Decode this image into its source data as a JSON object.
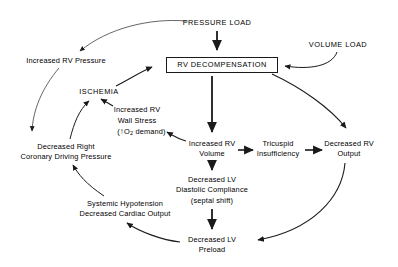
{
  "diagram": {
    "background_color": "#ffffff",
    "line_color": "#1a1a1a",
    "text_color": "#000000",
    "nodes": {
      "pressure_load": {
        "label": "PRESSURE LOAD",
        "x": 217,
        "y": 23
      },
      "volume_load": {
        "label": "VOLUME LOAD",
        "x": 338,
        "y": 45
      },
      "rv_decompensation": {
        "label": "RV DECOMPENSATION",
        "x": 222,
        "y": 65
      },
      "increased_rv_pressure": {
        "label": "Increased RV Pressure",
        "x": 66,
        "y": 61
      },
      "ischemia": {
        "label": "ISCHEMIA",
        "x": 99,
        "y": 92
      },
      "increased_rv_wall_stress_l1": {
        "label": "Increased RV",
        "x": 137,
        "y": 110
      },
      "increased_rv_wall_stress_l2": {
        "label": "Wall Stress",
        "x": 137,
        "y": 121
      },
      "increased_rv_wall_stress_l3": {
        "label": "(↑O2 demand)",
        "x": 137,
        "y": 133
      },
      "decreased_right_coronary_l1": {
        "label": "Decreased Right",
        "x": 66,
        "y": 147
      },
      "decreased_right_coronary_l2": {
        "label": "Coronary Driving Pressure",
        "x": 66,
        "y": 157
      },
      "increased_rv_volume_l1": {
        "label": "Increased RV",
        "x": 212,
        "y": 144
      },
      "increased_rv_volume_l2": {
        "label": "Volume",
        "x": 212,
        "y": 154
      },
      "tricuspid_insufficiency_l1": {
        "label": "Tricuspid",
        "x": 278,
        "y": 144
      },
      "tricuspid_insufficiency_l2": {
        "label": "Insufficiency",
        "x": 278,
        "y": 154
      },
      "decreased_rv_output_l1": {
        "label": "Decreased RV",
        "x": 349,
        "y": 144
      },
      "decreased_rv_output_l2": {
        "label": "Output",
        "x": 349,
        "y": 154
      },
      "decreased_lv_compliance_l1": {
        "label": "Decreased LV",
        "x": 212,
        "y": 180
      },
      "decreased_lv_compliance_l2": {
        "label": "Diastolic Compliance",
        "x": 212,
        "y": 190
      },
      "decreased_lv_compliance_l3": {
        "label": "(septal shift)",
        "x": 212,
        "y": 201
      },
      "systemic_hypotension_l1": {
        "label": "Systemic Hypotension",
        "x": 125,
        "y": 204
      },
      "systemic_hypotension_l2": {
        "label": "Decreased Cardiac Output",
        "x": 125,
        "y": 214
      },
      "decreased_lv_preload_l1": {
        "label": "Decreased LV",
        "x": 212,
        "y": 240
      },
      "decreased_lv_preload_l2": {
        "label": "Preload",
        "x": 212,
        "y": 250
      }
    },
    "edges": [
      {
        "from": "pressure_load",
        "to": "rv_decompensation",
        "style": "straight-thick"
      },
      {
        "from": "pressure_load",
        "to": "increased_rv_pressure",
        "style": "curved-thin"
      },
      {
        "from": "volume_load",
        "to": "rv_decompensation",
        "style": "curved-thin"
      },
      {
        "from": "increased_rv_pressure",
        "to": "decreased_right_coronary",
        "style": "curved-thin"
      },
      {
        "from": "decreased_right_coronary",
        "to": "ischemia",
        "style": "curved-thin"
      },
      {
        "from": "increased_rv_wall_stress",
        "to": "ischemia",
        "style": "straight-thin"
      },
      {
        "from": "ischemia",
        "to": "rv_decompensation",
        "style": "curved-thin"
      },
      {
        "from": "rv_decompensation",
        "to": "increased_rv_volume",
        "style": "straight-thick"
      },
      {
        "from": "rv_decompensation",
        "to": "decreased_rv_output",
        "style": "curved-thin"
      },
      {
        "from": "increased_rv_volume",
        "to": "increased_rv_wall_stress",
        "style": "straight-thin"
      },
      {
        "from": "increased_rv_volume",
        "to": "tricuspid_insufficiency",
        "style": "straight-thick"
      },
      {
        "from": "tricuspid_insufficiency",
        "to": "decreased_rv_output",
        "style": "straight-thick"
      },
      {
        "from": "increased_rv_volume",
        "to": "decreased_lv_compliance",
        "style": "straight-thick"
      },
      {
        "from": "decreased_lv_compliance",
        "to": "decreased_lv_preload",
        "style": "straight-thick"
      },
      {
        "from": "decreased_rv_output",
        "to": "decreased_lv_preload",
        "style": "curved-thin"
      },
      {
        "from": "decreased_lv_preload",
        "to": "systemic_hypotension",
        "style": "curved-thin"
      },
      {
        "from": "systemic_hypotension",
        "to": "decreased_right_coronary",
        "style": "curved-thin"
      }
    ]
  }
}
